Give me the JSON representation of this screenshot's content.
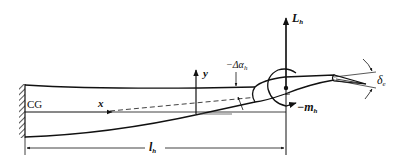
{
  "diagram": {
    "type": "horizontal-tail-aeroelastic-schematic",
    "colors": {
      "stroke": "#111111",
      "background": "#ffffff",
      "dimension_line": "#222222"
    },
    "labels": {
      "cg": "CG",
      "x_axis": "x",
      "y_axis": "y",
      "delta_alpha": {
        "prefix": "−Δα",
        "sub": "h"
      },
      "lift": {
        "main": "L",
        "sub": "h"
      },
      "moment": {
        "prefix": "−m",
        "sub": "h"
      },
      "elevator_deflection": {
        "main": "δ",
        "sub": "e"
      },
      "tail_arm": {
        "main": "l",
        "sub": "h"
      }
    },
    "elements": [
      {
        "name": "fixed-wall-support",
        "description": "hatched clamp at left"
      },
      {
        "name": "tail-boom-beam",
        "description": "tapered flexible boom deflecting upward"
      },
      {
        "name": "x-axis-arrow",
        "description": "horizontal axis from CG"
      },
      {
        "name": "y-axis-arrow",
        "description": "vertical axis"
      },
      {
        "name": "deflected-chord-line",
        "description": "dashed line"
      },
      {
        "name": "airfoil",
        "description": "horizontal tail section"
      },
      {
        "name": "elevator-flap",
        "description": "trailing-edge control surface"
      },
      {
        "name": "lift-arrow",
        "description": "vertical force L_h"
      },
      {
        "name": "pitching-moment-arrow",
        "description": "curved moment m_h"
      },
      {
        "name": "tail-arm-dimension",
        "description": "dimension l_h from CG to aerodynamic center"
      }
    ]
  }
}
